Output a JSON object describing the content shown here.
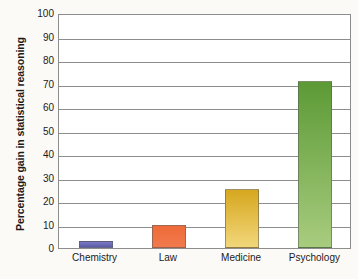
{
  "chart_data": {
    "type": "bar",
    "title": "",
    "subtitle": "",
    "xlabel": "",
    "ylabel": "Percentage gain in statistical reasoning",
    "categories": [
      "Chemistry",
      "Law",
      "Medicine",
      "Psychology"
    ],
    "values": [
      3,
      10,
      25,
      71
    ],
    "ylim": [
      0,
      100
    ],
    "ytick_labels": [
      "0",
      "10",
      "20",
      "30",
      "40",
      "50",
      "60",
      "70",
      "80",
      "90",
      "100"
    ],
    "ytick_values": [
      0,
      10,
      20,
      30,
      40,
      50,
      60,
      70,
      80,
      90,
      100
    ],
    "grid": true,
    "grid_axis": "y",
    "legend": false,
    "legend_position": "none",
    "series": [
      {
        "name": "Percentage gain in statistical reasoning",
        "values": [
          3,
          10,
          25,
          71
        ]
      }
    ],
    "bar_colors": [
      "#6b6bb8",
      "#ee6b3b",
      "#e8c34a",
      "#6faa3f"
    ],
    "bar_colors_top": [
      "#7a7ac4",
      "#ef6a38",
      "#d6a71f",
      "#5c9a36"
    ],
    "bar_colors_bottom": [
      "#5a5aa8",
      "#f07a4d",
      "#f2d77a",
      "#a8cc7e"
    ],
    "background_color": "#fbfaf7",
    "plot_background_color": "#ffffff",
    "axis_color": "#8d8d8d",
    "text_color": "#1b1b1b"
  }
}
